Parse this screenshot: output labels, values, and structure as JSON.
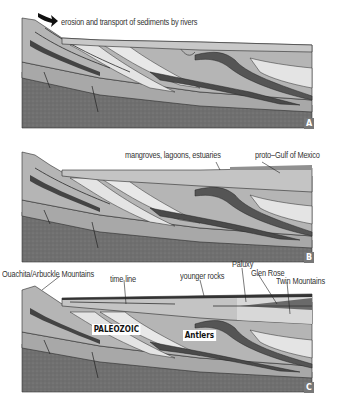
{
  "figure": {
    "type": "geologic cross-section sequence",
    "panels": [
      {
        "id": "A",
        "letter": "A",
        "labels": {
          "erosion": "erosion and transport of sediments by rivers"
        },
        "icons": [
          "curved-arrow-icon"
        ]
      },
      {
        "id": "B",
        "letter": "B",
        "labels": {
          "mangroves": "mangroves, lagoons, estuaries",
          "gulf": "proto–Gulf of Mexico"
        }
      },
      {
        "id": "C",
        "letter": "C",
        "labels": {
          "mountains": "Ouachita/Arbuckle Mountains",
          "time_line": "time line",
          "younger_rocks": "younger rocks",
          "paluxy": "Paluxy",
          "glen_rose": "Glen Rose",
          "twin_mountains": "Twin Mountains",
          "paleozoic": "PALEOZOIC",
          "antlers": "Antlers"
        }
      }
    ],
    "colors": {
      "basement": "#6f6f6f",
      "light_layer": "#e4e4e4",
      "mid_layer": "#b5b5b5",
      "dark_layer": "#555555",
      "cover": "#c8c8c8",
      "line": "#2a2a2a",
      "letter_bg": "#777777"
    }
  }
}
